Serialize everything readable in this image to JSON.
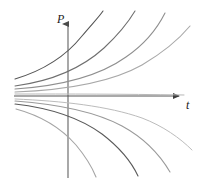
{
  "figure": {
    "title": "",
    "background": "#ffffff",
    "width": 199,
    "height": 187
  },
  "axes": {
    "vertical": {
      "label": "P",
      "name": "P-axis",
      "color": "#7a7a7a",
      "x": 68,
      "y_top": 20,
      "y_bottom": 178,
      "arrow": "up"
    },
    "horizontal": {
      "label": "t",
      "name": "t-axis",
      "color": "#555555",
      "y": 96,
      "x_left": 14,
      "x_right": 185,
      "arrow": "right"
    },
    "origin": {
      "x": 68,
      "y": 96
    }
  },
  "chart_data": {
    "type": "line",
    "title": "",
    "xlabel": "t",
    "ylabel": "P",
    "grid": false,
    "legend": null,
    "axis_style": "arrows-only-no-ticks",
    "xlim": [
      -54,
      117
    ],
    "ylim": [
      -82,
      76
    ],
    "series": [
      {
        "name": "curve-up-1",
        "color": "#555555",
        "width": 1.1,
        "direction": "increasing",
        "path": "M 15,79 C 45,70 66,56 82,36 C 92,24 99,17 103,11"
      },
      {
        "name": "curve-up-2",
        "color": "#6f6f6f",
        "width": 1.1,
        "direction": "increasing",
        "path": "M 15,86 C 52,81 82,68 104,48 C 119,34 129,21 135,11"
      },
      {
        "name": "curve-up-3",
        "color": "#8f8f8f",
        "width": 1.1,
        "direction": "increasing",
        "path": "M 15,89 C 60,86 98,77 126,57 C 145,44 158,27 165,13"
      },
      {
        "name": "curve-up-4",
        "color": "#a8a8a8",
        "width": 1.1,
        "direction": "increasing",
        "path": "M 15,92 C 66,90 110,83 142,65 C 164,52 180,38 190,26"
      },
      {
        "name": "curve-asymptote",
        "color": "#b8b8b8",
        "width": 1.0,
        "direction": "asymptotic",
        "path": "M 15,94 C 70,94 120,94 184,95"
      },
      {
        "name": "curve-down-1",
        "color": "#bcbcbc",
        "width": 1.0,
        "direction": "decreasing",
        "path": "M 15,99 C 62,101 108,106 142,118 C 163,126 180,138 192,150"
      },
      {
        "name": "curve-down-2",
        "color": "#9a9a9a",
        "width": 1.1,
        "direction": "decreasing",
        "path": "M 15,101 C 56,104 94,111 122,126 C 144,138 160,155 170,172"
      },
      {
        "name": "curve-down-3",
        "color": "#5a5a5a",
        "width": 1.1,
        "direction": "decreasing",
        "path": "M 15,104 C 50,108 80,118 102,134 C 119,147 131,161 138,176"
      },
      {
        "name": "curve-down-4",
        "color": "#a5a5a5",
        "width": 1.1,
        "direction": "decreasing",
        "path": "M 16,109 C 42,116 62,129 76,145 C 86,157 92,167 96,177"
      }
    ]
  }
}
